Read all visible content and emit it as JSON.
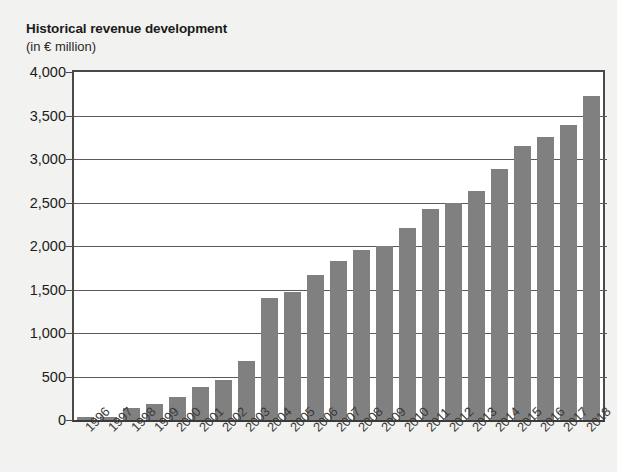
{
  "chart_data": {
    "type": "bar",
    "title": "Historical revenue development",
    "subtitle": "(in € million)",
    "xlabel": "",
    "ylabel": "",
    "ylim": [
      0,
      4000
    ],
    "ytick_labels": [
      "4,000",
      "3,500",
      "3,000",
      "2,500",
      "2,000",
      "1,500",
      "1,000",
      "500",
      "0"
    ],
    "ytick_values": [
      4000,
      3500,
      3000,
      2500,
      2000,
      1500,
      1000,
      500,
      0
    ],
    "grid": true,
    "legend": "none",
    "bar_color": "#808080",
    "plot_background": "#ffffff",
    "page_background": "#f2f2f0",
    "categories": [
      "1996",
      "1997",
      "1998",
      "1999",
      "2000",
      "2001",
      "2002",
      "2003",
      "2004",
      "2005",
      "2006",
      "2007",
      "2008",
      "2009",
      "2010",
      "2011",
      "2012",
      "2013",
      "2014",
      "2015",
      "2016",
      "2017",
      "2018"
    ],
    "values": [
      30,
      35,
      140,
      180,
      265,
      375,
      460,
      680,
      1400,
      1470,
      1670,
      1830,
      1950,
      2000,
      2210,
      2420,
      2500,
      2630,
      2880,
      3150,
      3250,
      3390,
      3720
    ]
  }
}
